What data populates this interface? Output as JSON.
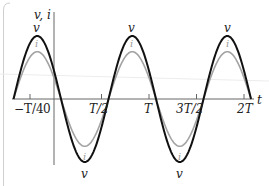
{
  "chart_data": {
    "type": "line",
    "title": "",
    "xlabel": "t",
    "ylabel": "v, i",
    "x_ticks": [
      {
        "label": "−T/4",
        "value": -0.25
      },
      {
        "label": "0",
        "value": 0
      },
      {
        "label": "T/2",
        "value": 0.5
      },
      {
        "label": "T",
        "value": 1.0
      },
      {
        "label": "3T/2",
        "value": 1.5
      },
      {
        "label": "2T",
        "value": 2.0
      }
    ],
    "x_unit": "T",
    "xlim": [
      -0.44,
      2.08
    ],
    "grid": false,
    "legend": "inline curve labels",
    "series": [
      {
        "name": "v",
        "color": "#111111",
        "shape": "sinusoid",
        "amplitude": 1.0,
        "period": 1.0,
        "zero_rising_at": -0.426,
        "peaks_at": [
          -0.176,
          0.824,
          1.824
        ],
        "troughs_at": [
          0.324,
          1.324
        ],
        "zero_crossings": [
          -0.426,
          0.074,
          0.574,
          1.074,
          1.574,
          2.074
        ]
      },
      {
        "name": "i",
        "color": "#a0a0a0",
        "shape": "sinusoid",
        "amplitude": 0.75,
        "period": 1.0,
        "zero_rising_at": -0.426,
        "peaks_at": [
          -0.176,
          0.824,
          1.824
        ],
        "troughs_at": [
          0.324,
          1.324
        ],
        "phase_relation": "in phase with v"
      }
    ],
    "annotations": [
      "v",
      "i",
      "v",
      "i",
      "v",
      "i",
      "v",
      "i",
      "v",
      "i"
    ]
  },
  "labels": {
    "y_axis": "v, i",
    "x_axis": "t",
    "ticks": [
      "−T/4",
      "0",
      "T/2",
      "T",
      "3T/2",
      "2T"
    ],
    "v": "v",
    "i": "i"
  },
  "colors": {
    "v_curve": "#111111",
    "i_curve": "#a0a0a0",
    "axes": "#555555"
  }
}
